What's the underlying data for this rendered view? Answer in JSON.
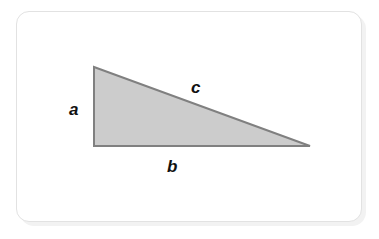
{
  "page": {
    "background_color": "#ffffff",
    "width": 379,
    "height": 239
  },
  "card": {
    "name": "diagram-card",
    "background_color": "#ffffff",
    "border_color": "#e2e2e2",
    "shadow_color": "#f2f2f2",
    "corner_radius": 13,
    "x": 16,
    "y": 11,
    "width": 346,
    "height": 211
  },
  "figure": {
    "type": "right-triangle-diagram",
    "shape": {
      "name": "right-triangle",
      "fill_color": "#cccccc",
      "stroke_color": "#808080",
      "stroke_width": 2,
      "vertices": [
        {
          "name": "top-left-vertex",
          "x": 94,
          "y": 67
        },
        {
          "name": "bottom-right-vertex",
          "x": 310,
          "y": 146
        },
        {
          "name": "bottom-left-vertex",
          "x": 94,
          "y": 146
        }
      ],
      "right_angle_at": "bottom-left-vertex"
    },
    "labels": [
      {
        "id": "a",
        "text": "a",
        "side": "vertical-leg",
        "x": 69,
        "y": 101
      },
      {
        "id": "b",
        "text": "b",
        "side": "horizontal-leg",
        "x": 167,
        "y": 158
      },
      {
        "id": "c",
        "text": "c",
        "side": "hypotenuse",
        "x": 191,
        "y": 79
      }
    ]
  }
}
